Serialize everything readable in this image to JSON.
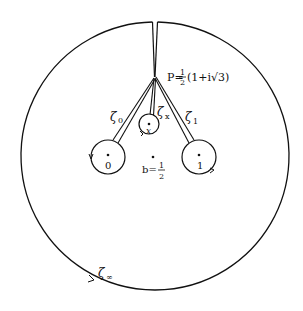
{
  "diagram": {
    "point_P": {
      "label": "P",
      "expr_prefix": "P=",
      "frac_num": "1",
      "frac_den": "2",
      "expr_rest": "(1+i√3)"
    },
    "paths": [
      {
        "id": "zeta_0",
        "label": "ζ",
        "sub": "0"
      },
      {
        "id": "zeta_x",
        "label": "ζ",
        "sub": "x"
      },
      {
        "id": "zeta_1",
        "label": "ζ",
        "sub": "1"
      },
      {
        "id": "zeta_inf",
        "label": "ζ",
        "sub": "∞"
      }
    ],
    "points": [
      {
        "id": "zero",
        "label": "0"
      },
      {
        "id": "x",
        "label": "x"
      },
      {
        "id": "one",
        "label": "1"
      }
    ],
    "base_point": {
      "prefix": "b=",
      "frac_num": "1",
      "frac_den": "2"
    },
    "colors": {
      "stroke": "#111111",
      "background": "#ffffff"
    }
  }
}
